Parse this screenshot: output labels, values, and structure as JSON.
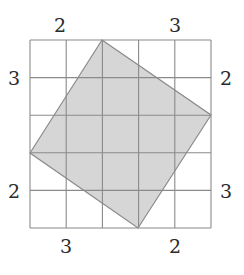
{
  "diagram": {
    "grid": {
      "cols": 5,
      "rows": 5,
      "x0": 30,
      "y0": 40,
      "x1": 211,
      "y1": 228,
      "line_color": "#8a8a8a"
    },
    "polygon": {
      "fill": "#d6d6d6",
      "stroke": "#8a8a8a",
      "vertices": [
        [
          102,
          40
        ],
        [
          211,
          115
        ],
        [
          138,
          228
        ],
        [
          30,
          153
        ]
      ]
    },
    "labels": {
      "top_left": "2",
      "top_right": "3",
      "left_top": "3",
      "left_bottom": "2",
      "right_top": "2",
      "right_bottom": "3",
      "bottom_left": "3",
      "bottom_right": "2"
    }
  }
}
